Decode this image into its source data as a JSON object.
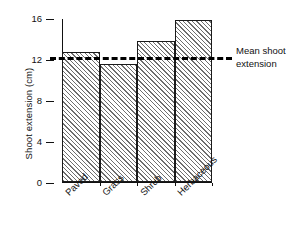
{
  "chart_data": {
    "type": "bar",
    "title": "",
    "xlabel": "",
    "ylabel": "Shoot extension (cm)",
    "categories": [
      "Paved",
      "Grass",
      "Shrub",
      "Herbaceous"
    ],
    "values": [
      12.7,
      11.5,
      13.8,
      15.8
    ],
    "ylim": [
      0,
      16
    ],
    "yticks": [
      0,
      4,
      8,
      12,
      16
    ],
    "ytick_labels": [
      "0",
      "4",
      "8",
      "12",
      "16"
    ],
    "grid": false,
    "legend_position": "right",
    "annotations": [
      {
        "name": "mean-shoot-extension",
        "label_line1": "Mean shoot",
        "label_line2": "extension",
        "value": 12.3,
        "style": "dashed-horizontal-line",
        "color": "#000000"
      }
    ],
    "bar_style": {
      "fill": "diagonal-hatch",
      "hatch_color": "#6e6e6e",
      "background": "#ffffff",
      "edge_color": "#1a1a1a"
    }
  },
  "axis": {
    "y_title": "Shoot extension (cm)",
    "tick_0": "0",
    "tick_4": "4",
    "tick_8": "8",
    "tick_12": "12",
    "tick_16": "16"
  },
  "legend": {
    "line1": "Mean shoot",
    "line2": "extension"
  },
  "xlabels": {
    "cat0": "Paved",
    "cat1": "Grass",
    "cat2": "Shrub",
    "cat3": "Herbaceous"
  }
}
